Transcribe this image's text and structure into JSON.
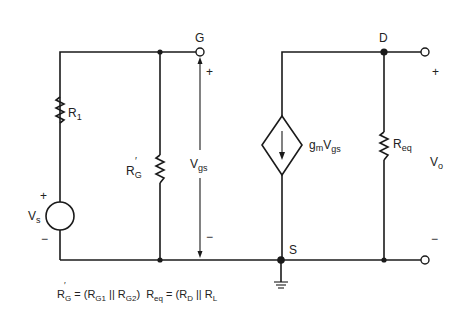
{
  "diagram": {
    "type": "small-signal equivalent circuit",
    "colors": {
      "line": "#1a1a1a",
      "background": "#ffffff",
      "text": "#222222"
    },
    "nodes": {
      "gate": {
        "label": "G"
      },
      "drain": {
        "label": "D"
      },
      "source": {
        "label": "S"
      }
    },
    "components": {
      "r1": {
        "main": "R",
        "sub": "1"
      },
      "rg": {
        "main": "R",
        "sub": "G",
        "prime": "′"
      },
      "source_vs": {
        "main": "V",
        "sub": "s",
        "plus": "+",
        "minus": "−"
      },
      "current_source": {
        "g": "g",
        "gsub": "m",
        "v": "V",
        "vsub": "gs"
      },
      "req": {
        "main": "R",
        "sub": "eq"
      }
    },
    "voltages": {
      "vgs": {
        "main": "V",
        "sub": "gs",
        "plus": "+",
        "minus": "−"
      },
      "vo": {
        "main": "V",
        "sub": "o",
        "plus": "+",
        "minus": "−"
      }
    },
    "formula": {
      "rg_main": "R",
      "rg_prime": "′",
      "rg_sub": "G",
      "eq1": " = (R",
      "g1": "G1",
      "par1": " || R",
      "g2": "G2",
      "close1": ")",
      "req_main": "R",
      "req_sub": "eq",
      "eq2": " = (R",
      "d": "D",
      "par2": " || R",
      "l": "L"
    }
  }
}
